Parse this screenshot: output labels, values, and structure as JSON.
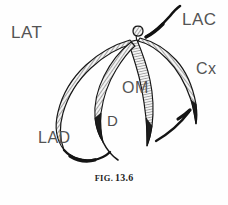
{
  "figure": {
    "view_label": "LAT",
    "caption_prefix": "FIG.",
    "caption_number": "13.6",
    "caption_full": "FIG. 13.6",
    "background_color": "#fefefe",
    "ink_color": "#1a1a1a",
    "label_color": "#545454",
    "vessel_fill_color": "#f2f2f2",
    "vessel_hatch_color": "#333333"
  },
  "labels": [
    {
      "id": "lat",
      "text": "LAT",
      "meaning": "lateral-view",
      "x": 11,
      "y": 24
    },
    {
      "id": "lac",
      "text": "LAC",
      "meaning": "left-atrial-contour",
      "x": 182,
      "y": 11
    },
    {
      "id": "cx",
      "text": "Cx",
      "meaning": "circumflex-artery",
      "x": 196,
      "y": 61
    },
    {
      "id": "om",
      "text": "OM",
      "meaning": "obtuse-marginal",
      "x": 122,
      "y": 80
    },
    {
      "id": "d",
      "text": "D",
      "meaning": "diagonal-branch",
      "x": 107,
      "y": 113
    },
    {
      "id": "lad",
      "text": "LAD",
      "meaning": "left-anterior-descending",
      "x": 38,
      "y": 130
    }
  ],
  "vessels": [
    {
      "id": "left-main",
      "name": "left-main-stem"
    },
    {
      "id": "lad",
      "name": "left-anterior-descending-artery"
    },
    {
      "id": "diagonal",
      "name": "diagonal-branch"
    },
    {
      "id": "om",
      "name": "obtuse-marginal-branch"
    },
    {
      "id": "cx",
      "name": "circumflex-artery"
    },
    {
      "id": "lac-contour",
      "name": "left-atrial-contour-line"
    }
  ]
}
